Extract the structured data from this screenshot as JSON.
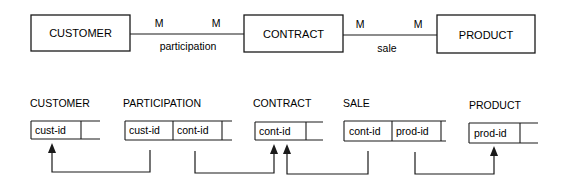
{
  "er_diagram": {
    "entities": [
      {
        "name": "CUSTOMER"
      },
      {
        "name": "CONTRACT"
      },
      {
        "name": "PRODUCT"
      }
    ],
    "relationships": [
      {
        "name": "participation",
        "from": "CUSTOMER",
        "to": "CONTRACT",
        "card_left": "M",
        "card_right": "M"
      },
      {
        "name": "sale",
        "from": "CONTRACT",
        "to": "PRODUCT",
        "card_left": "M",
        "card_right": "M"
      }
    ]
  },
  "relational_tables": [
    {
      "name": "CUSTOMER",
      "columns": [
        "cust-id",
        ""
      ]
    },
    {
      "name": "PARTICIPATION",
      "columns": [
        "cust-id",
        "cont-id",
        ""
      ]
    },
    {
      "name": "CONTRACT",
      "columns": [
        "cont-id",
        ""
      ]
    },
    {
      "name": "SALE",
      "columns": [
        "cont-id",
        "prod-id",
        ""
      ]
    },
    {
      "name": "PRODUCT",
      "columns": [
        "prod-id",
        ""
      ]
    }
  ],
  "foreign_keys": [
    {
      "from": "PARTICIPATION.cust-id",
      "to": "CUSTOMER.cust-id"
    },
    {
      "from": "PARTICIPATION.cont-id",
      "to": "CONTRACT.cont-id"
    },
    {
      "from": "SALE.cont-id",
      "to": "CONTRACT.cont-id"
    },
    {
      "from": "SALE.prod-id",
      "to": "PRODUCT.prod-id"
    }
  ]
}
